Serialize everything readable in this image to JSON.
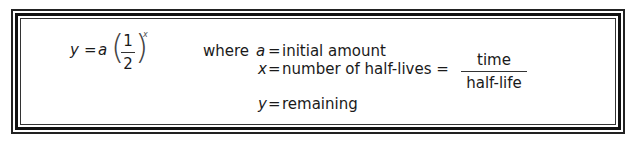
{
  "formula": {
    "lhs": "y",
    "equals": "=",
    "coef": "a",
    "numerator": "1",
    "denominator": "2",
    "exponent": "x"
  },
  "definitions": {
    "where_label": "where",
    "a": {
      "var": "a",
      "eq": "=",
      "text": "initial amount"
    },
    "x": {
      "var": "x",
      "eq": "=",
      "text": "number of half-lives =",
      "frac_num": "time",
      "frac_den": "half-life"
    },
    "y": {
      "var": "y",
      "eq": "=",
      "text": "remaining"
    }
  }
}
